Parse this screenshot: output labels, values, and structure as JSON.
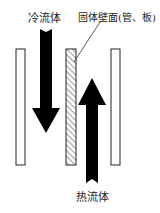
{
  "labels": {
    "cold_fluid": "冷流体",
    "solid_wall": "固体壁面(管、板)",
    "hot_fluid": "热流体"
  },
  "colors": {
    "arrow": "#000000",
    "wall_stroke": "#222222",
    "background": "#ffffff"
  }
}
